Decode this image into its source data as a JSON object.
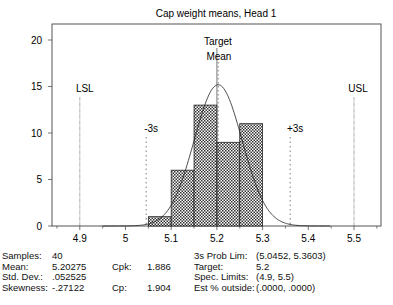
{
  "chart_data": {
    "type": "bar",
    "title": "Cap weight means, Head 1",
    "xlabel": "",
    "ylabel": "",
    "xlim": [
      4.84,
      5.56
    ],
    "ylim": [
      0,
      22
    ],
    "x_ticks": [
      4.9,
      5,
      5.1,
      5.2,
      5.3,
      5.4,
      5.5
    ],
    "x_tick_labels": [
      "4.9",
      "5",
      "5.1",
      "5.2",
      "5.3",
      "5.4",
      "5.5"
    ],
    "y_ticks": [
      0,
      5,
      10,
      15,
      20
    ],
    "y_tick_labels": [
      "0",
      "5",
      "10",
      "15",
      "20"
    ],
    "grid": false,
    "bins": [
      {
        "start": 5.05,
        "end": 5.1,
        "count": 1
      },
      {
        "start": 5.1,
        "end": 5.15,
        "count": 6
      },
      {
        "start": 5.15,
        "end": 5.2,
        "count": 13
      },
      {
        "start": 5.2,
        "end": 5.25,
        "count": 9
      },
      {
        "start": 5.25,
        "end": 5.3,
        "count": 11
      }
    ],
    "categories": [
      "5.05-5.10",
      "5.10-5.15",
      "5.15-5.20",
      "5.20-5.25",
      "5.25-5.30"
    ],
    "values": [
      1,
      6,
      13,
      9,
      11
    ],
    "fit_curve": {
      "type": "normal",
      "mean": 5.20275,
      "std": 0.052525,
      "samples": 40,
      "bin_width": 0.05
    },
    "reference_lines": [
      {
        "label": "LSL",
        "x": 4.9,
        "style": "solid-thin"
      },
      {
        "label": "-3s",
        "x": 5.0452,
        "style": "dotted"
      },
      {
        "label": "Target",
        "x": 5.2,
        "style": "solid-thin"
      },
      {
        "label": "Mean",
        "x": 5.20275,
        "style": "dotted"
      },
      {
        "label": "+3s",
        "x": 5.3603,
        "style": "dotted"
      },
      {
        "label": "USL",
        "x": 5.5,
        "style": "solid-thin"
      }
    ],
    "annotations": [
      "LSL",
      "-3s",
      "Target",
      "Mean",
      "+3s",
      "USL"
    ]
  },
  "stats": {
    "left": [
      {
        "label": "Samples:",
        "value": "40"
      },
      {
        "label": "Mean:",
        "value": "5.20275"
      },
      {
        "label": "Std. Dev.:",
        "value": ".052525"
      },
      {
        "label": "Skewness:",
        "value": "-.27122"
      }
    ],
    "middle": [
      {
        "label": "Cpk:",
        "value": "1.886"
      },
      {
        "label": "Cp:",
        "value": "1.904"
      }
    ],
    "right": [
      {
        "label": "3s Prob Lim:",
        "value": "(5.0452, 5.3603)"
      },
      {
        "label": "Target:",
        "value": "5.2"
      },
      {
        "label": "Spec. Limits:",
        "value": "(4.9, 5.5)"
      },
      {
        "label": "Est % outside:",
        "value": "(.0000, .0000)"
      }
    ]
  }
}
